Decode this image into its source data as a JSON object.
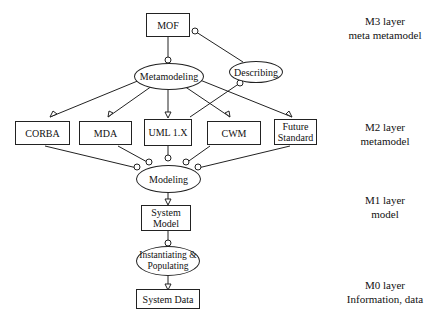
{
  "nodes": {
    "mof": "MOF",
    "metamodeling": "Metamodeling",
    "describing": "Describing",
    "corba": "CORBA",
    "mda": "MDA",
    "uml": "UML 1.X",
    "cwm": "CWM",
    "future_line1": "Future",
    "future_line2": "Standard",
    "modeling": "Modeling",
    "system_model_line1": "System",
    "system_model_line2": "Model",
    "inst_line1": "Instantiating &",
    "inst_line2": "Populating",
    "system_data": "System Data"
  },
  "layers": [
    {
      "name": "M3 layer",
      "desc": "meta metamodel"
    },
    {
      "name": "M2 layer",
      "desc": "metamodel"
    },
    {
      "name": "M1 layer",
      "desc": "model"
    },
    {
      "name": "M0 layer",
      "desc": "Information, data"
    }
  ]
}
